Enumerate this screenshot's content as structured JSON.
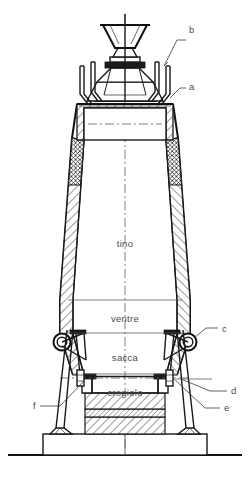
{
  "figure": {
    "background_color": "#ffffff",
    "line_color": "#1b1b1b",
    "text_color": "#4b4b4b",
    "centerline_color": "#5d5d5d"
  },
  "zones": [
    {
      "key": "tino",
      "label": "tino",
      "x": 125,
      "y": 247
    },
    {
      "key": "ventre",
      "label": "ventre",
      "x": 125,
      "y": 322
    },
    {
      "key": "sacca",
      "label": "sacca",
      "x": 125,
      "y": 361
    },
    {
      "key": "crogiolo",
      "label": "crogiolo",
      "x": 125,
      "y": 396
    }
  ],
  "callouts": [
    {
      "key": "a",
      "label": "a",
      "text_x": 189,
      "text_y": 90
    },
    {
      "key": "b",
      "label": "b",
      "text_x": 189,
      "text_y": 33
    },
    {
      "key": "c",
      "label": "c",
      "text_x": 222,
      "text_y": 332
    },
    {
      "key": "d",
      "label": "d",
      "text_x": 231,
      "text_y": 394
    },
    {
      "key": "e",
      "label": "e",
      "text_x": 224,
      "text_y": 411
    },
    {
      "key": "f",
      "label": "f",
      "text_x": 33,
      "text_y": 409
    }
  ],
  "hatching": {
    "refractory_pattern": "diagonal-45",
    "cooling_pattern": "cross-hatch"
  }
}
